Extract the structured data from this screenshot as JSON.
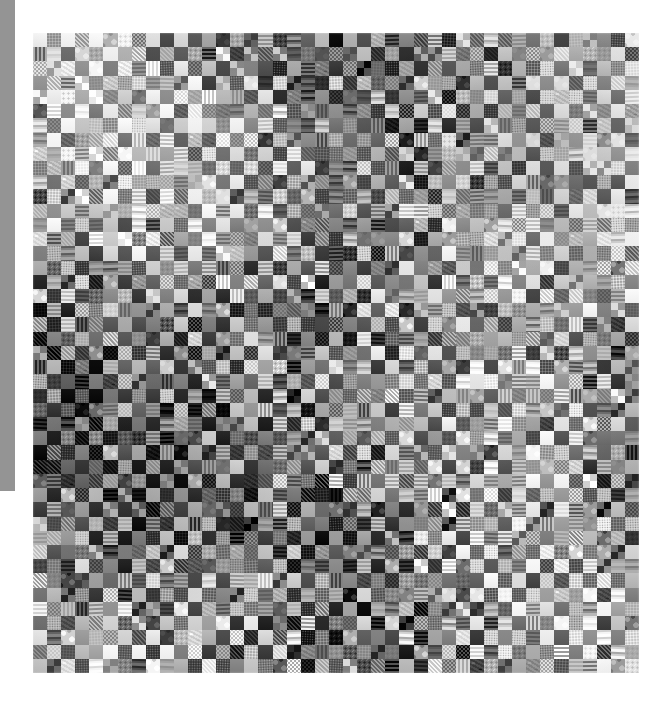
{
  "page": {
    "background_color": "#ffffff",
    "width": 664,
    "height": 702
  },
  "left_gutter": {
    "name": "page-gutter-strip",
    "color": "#949494",
    "x": 0,
    "y": 0,
    "width": 15,
    "height": 491
  },
  "photo": {
    "subject": "patchwork quilt",
    "description": "Grayscale photograph of a large square patchwork quilt composed of small fabric squares arranged in a checkerboard of alternating light and dark prints",
    "color_mode": "grayscale",
    "x": 33,
    "y": 33,
    "width": 606,
    "height": 640,
    "grid_columns": 43,
    "grid_rows": 45,
    "patch_size_px": 14,
    "palette": {
      "darkest": "#101010",
      "dark": "#2b2b2b",
      "mid_dark": "#4a4a4a",
      "mid": "#6e6e6e",
      "mid_light": "#949494",
      "light": "#b8b8b8",
      "lightest": "#e2e2e2"
    },
    "fabric_patterns": [
      "plaid",
      "gingham-check",
      "polka-dot",
      "floral",
      "small-floral",
      "speckle",
      "solid",
      "stripe",
      "cross-hatch",
      "paisley",
      "houndstooth",
      "calico"
    ]
  },
  "chart_data": {
    "type": "heatmap",
    "title": "",
    "xlabel": "",
    "ylabel": "",
    "grid": true,
    "legend": "none",
    "note": "Checkerboard quilt: value = relative grayscale lightness of each fabric patch (0 = black, 1 = white)",
    "columns": 43,
    "rows": 45,
    "seed": 20240517,
    "light_mean": 0.72,
    "dark_mean": 0.3,
    "value_spread": 0.22
  }
}
